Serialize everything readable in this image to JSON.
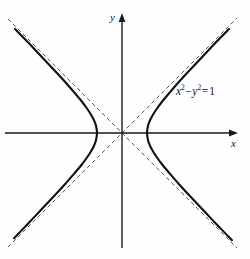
{
  "figure": {
    "kind": "hyperbola-plot",
    "background_color": "#fefefe",
    "width": 250,
    "height": 259
  },
  "axes": {
    "x_label": "x",
    "y_label": "y",
    "axis_color": "#1a1a1a",
    "origin_px": {
      "x": 122,
      "y": 133
    },
    "x_axis_start_px": 5,
    "x_axis_end_px": 238,
    "y_axis_top_px": 13,
    "y_axis_bottom_px": 248,
    "arrowheads": "both-positive-directions",
    "ticks": [],
    "gridlines": false
  },
  "annotation": {
    "equation_text": "x2-y2 = 1",
    "equation_parts": {
      "x_var": "x",
      "x_exp": "2",
      "minus": "−",
      "y_var": "y",
      "y_exp": "2",
      "equals": "=",
      "rhs": "1"
    },
    "position_px": {
      "x": 176,
      "y": 86
    }
  },
  "chart_data": {
    "type": "line",
    "title": "",
    "subtitle": "",
    "xlabel": "x",
    "ylabel": "y",
    "equation": "x^2 - y^2 = 1",
    "curve_color": "#111111",
    "curve_width_px": 2.1,
    "asymptote_color": "#555555",
    "asymptote_width_px": 1,
    "asymptote_dash": "4 3",
    "grid": false,
    "legend": null,
    "xlim": [
      -4.7,
      4.6
    ],
    "ylim": [
      -4.6,
      4.8
    ],
    "units_per_px": 0.04,
    "scale_px_per_unit": 25,
    "vertices": [
      {
        "x": -1,
        "y": 0,
        "px": {
          "x": 97,
          "y": 133
        }
      },
      {
        "x": 1,
        "y": 0,
        "px": {
          "x": 147,
          "y": 133
        }
      }
    ],
    "asymptotes": [
      {
        "name": "y = x",
        "slope": 1,
        "intercept": 0,
        "px_from": {
          "x": 8,
          "y": 247
        },
        "px_to": {
          "x": 237,
          "y": 18
        }
      },
      {
        "name": "y = -x",
        "slope": -1,
        "intercept": 0,
        "px_from": {
          "x": 8,
          "y": 19
        },
        "px_to": {
          "x": 237,
          "y": 248
        }
      }
    ],
    "series": [
      {
        "name": "right branch",
        "comment": "x = cosh t, y = sinh t",
        "points": [
          {
            "x": 4.28,
            "y": 4.16
          },
          {
            "x": 3.8,
            "y": 3.67
          },
          {
            "x": 3.3,
            "y": 3.14
          },
          {
            "x": 2.8,
            "y": 2.61
          },
          {
            "x": 2.3,
            "y": 2.07
          },
          {
            "x": 1.9,
            "y": 1.61
          },
          {
            "x": 1.6,
            "y": 1.25
          },
          {
            "x": 1.4,
            "y": 0.98
          },
          {
            "x": 1.25,
            "y": 0.75
          },
          {
            "x": 1.12,
            "y": 0.51
          },
          {
            "x": 1.04,
            "y": 0.29
          },
          {
            "x": 1.0,
            "y": 0.0
          },
          {
            "x": 1.04,
            "y": -0.29
          },
          {
            "x": 1.12,
            "y": -0.51
          },
          {
            "x": 1.25,
            "y": -0.75
          },
          {
            "x": 1.4,
            "y": -0.98
          },
          {
            "x": 1.6,
            "y": -1.25
          },
          {
            "x": 1.9,
            "y": -1.61
          },
          {
            "x": 2.3,
            "y": -2.07
          },
          {
            "x": 2.8,
            "y": -2.61
          },
          {
            "x": 3.3,
            "y": -3.14
          },
          {
            "x": 3.8,
            "y": -3.67
          },
          {
            "x": 4.4,
            "y": -4.29
          }
        ]
      },
      {
        "name": "left branch",
        "comment": "x = -cosh t, y = sinh t",
        "points": [
          {
            "x": -4.28,
            "y": 4.16
          },
          {
            "x": -3.8,
            "y": 3.67
          },
          {
            "x": -3.3,
            "y": 3.14
          },
          {
            "x": -2.8,
            "y": 2.61
          },
          {
            "x": -2.3,
            "y": 2.07
          },
          {
            "x": -1.9,
            "y": 1.61
          },
          {
            "x": -1.6,
            "y": 1.25
          },
          {
            "x": -1.4,
            "y": 0.98
          },
          {
            "x": -1.25,
            "y": 0.75
          },
          {
            "x": -1.12,
            "y": 0.51
          },
          {
            "x": -1.04,
            "y": 0.29
          },
          {
            "x": -1.0,
            "y": 0.0
          },
          {
            "x": -1.04,
            "y": -0.29
          },
          {
            "x": -1.12,
            "y": -0.51
          },
          {
            "x": -1.25,
            "y": -0.75
          },
          {
            "x": -1.4,
            "y": -0.98
          },
          {
            "x": -1.6,
            "y": -1.25
          },
          {
            "x": -1.9,
            "y": -1.61
          },
          {
            "x": -2.3,
            "y": -2.07
          },
          {
            "x": -2.8,
            "y": -2.61
          },
          {
            "x": -3.3,
            "y": -3.14
          },
          {
            "x": -3.8,
            "y": -3.67
          },
          {
            "x": -4.32,
            "y": -4.21
          }
        ]
      }
    ]
  }
}
